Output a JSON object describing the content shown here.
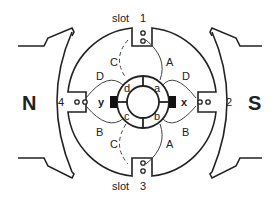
{
  "diagram": {
    "poles": {
      "left": "N",
      "right": "S"
    },
    "slots": [
      {
        "id": "slot1",
        "label": "slot",
        "number": "1"
      },
      {
        "id": "slot2",
        "number": "2"
      },
      {
        "id": "slot3",
        "label": "slot",
        "number": "3"
      },
      {
        "id": "slot4",
        "number": "4"
      }
    ],
    "brushes": {
      "left": "y",
      "right": "x"
    },
    "commutator_segments": [
      "a",
      "b",
      "c",
      "d"
    ],
    "coil_labels": {
      "top_left": "C",
      "top_right": "A",
      "upper_left": "D",
      "upper_right": "D",
      "lower_left": "B",
      "lower_right": "B",
      "bottom_left": "C",
      "bottom_right": "A"
    }
  }
}
